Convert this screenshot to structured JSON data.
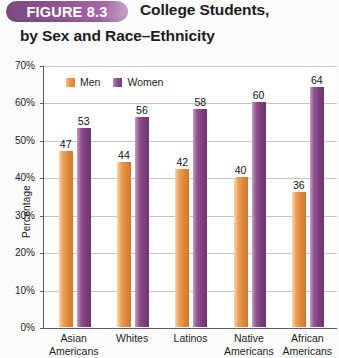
{
  "figure": {
    "badge_label": "FIGURE 8.3",
    "title_line1": "College Students,",
    "title_line2": "by Sex and Race–Ethnicity"
  },
  "legend": {
    "men_label": "Men",
    "women_label": "Women",
    "men_color": "#e0893c",
    "women_color": "#7c3f7e"
  },
  "axis": {
    "y_title": "Percentage",
    "y_ticks": [
      "70%",
      "60%",
      "50%",
      "40%",
      "30%",
      "20%",
      "10%",
      "0%"
    ]
  },
  "chart_data": {
    "type": "bar",
    "title": "FIGURE 8.3 College Students, by Sex and Race–Ethnicity",
    "xlabel": "",
    "ylabel": "Percentage",
    "ylim": [
      0,
      70
    ],
    "ytick_step": 10,
    "grid": true,
    "legend_position": "top-left inside plot",
    "categories": [
      "Asian Americans",
      "Whites",
      "Latinos",
      "Native Americans",
      "African Americans"
    ],
    "category_lines": [
      [
        "Asian",
        "Americans"
      ],
      [
        "Whites",
        ""
      ],
      [
        "Latinos",
        ""
      ],
      [
        "Native",
        "Americans"
      ],
      [
        "African",
        "Americans"
      ]
    ],
    "series": [
      {
        "name": "Men",
        "color": "#e0893c",
        "values": [
          47,
          44,
          42,
          40,
          36
        ]
      },
      {
        "name": "Women",
        "color": "#7c3f7e",
        "values": [
          53,
          56,
          58,
          60,
          64
        ]
      }
    ]
  }
}
